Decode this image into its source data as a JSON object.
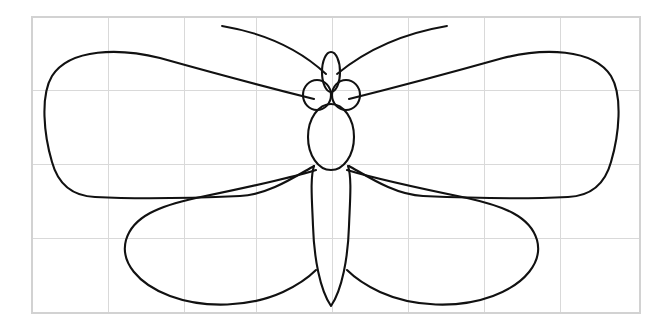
{
  "document": {
    "title": "Butterfly Line Drawing",
    "subject": "butterfly",
    "style": "black outline line art on white background with light gray grid overlay",
    "width_px": 663,
    "height_px": 327,
    "has_text": false,
    "caption": ""
  },
  "colors": {
    "background": "#ffffff",
    "ink": "#111111",
    "grid_line": "#d9d9d9",
    "grid_border": "#d2d2d2"
  },
  "grid": {
    "label": "reference grid",
    "visible": true,
    "border_left": 32,
    "border_top": 17,
    "border_right": 640,
    "border_bottom": 313,
    "columns": 8,
    "rows": 4,
    "cell_width": 76,
    "cell_height": 74,
    "vertical_lines": [
      32,
      108,
      184,
      256,
      332,
      408,
      484,
      560,
      640
    ],
    "horizontal_lines": [
      17,
      90,
      164,
      238,
      313
    ]
  },
  "figure": {
    "name": "butterfly",
    "axis_of_symmetry_x": 331,
    "parts": [
      {
        "id": "antenna-left",
        "label": "left antenna",
        "tip": [
          222,
          26
        ],
        "base": [
          326,
          72
        ],
        "path": "M 222 26 C 258 32 296 46 326 74"
      },
      {
        "id": "antenna-right",
        "label": "right antenna",
        "tip": [
          447,
          26
        ],
        "base": [
          336,
          72
        ],
        "path": "M 447 26 C 411 32 371 46 337 74"
      },
      {
        "id": "head-proboscis",
        "label": "head crown ellipse",
        "center": [
          331,
          72
        ],
        "rx": 9,
        "ry": 20
      },
      {
        "id": "eye-left",
        "label": "left eye circle",
        "center": [
          317,
          95
        ],
        "rx": 14,
        "ry": 15
      },
      {
        "id": "eye-right",
        "label": "right eye circle",
        "center": [
          346,
          95
        ],
        "rx": 14,
        "ry": 15
      },
      {
        "id": "thorax",
        "label": "thorax oval",
        "center": [
          331,
          137
        ],
        "rx": 23,
        "ry": 33
      },
      {
        "id": "abdomen",
        "label": "abdomen tapering to pointed tip",
        "top_y": 168,
        "tip": [
          331,
          306
        ],
        "max_half_width": 17
      },
      {
        "id": "forewing-left",
        "label": "left forewing",
        "attach": [
          314,
          99
        ],
        "outer_tip": [
          47,
          120
        ],
        "top_apex": [
          115,
          55
        ],
        "trailing_edge_end": [
          240,
          196
        ]
      },
      {
        "id": "forewing-right",
        "label": "right forewing",
        "attach": [
          349,
          99
        ],
        "outer_tip": [
          616,
          120
        ],
        "top_apex": [
          548,
          55
        ],
        "trailing_edge_end": [
          423,
          196
        ]
      },
      {
        "id": "hindwing-left",
        "label": "left hindwing",
        "attach": [
          316,
          170
        ],
        "outer_tip": [
          128,
          238
        ],
        "bottom_end": [
          300,
          278
        ]
      },
      {
        "id": "hindwing-right",
        "label": "right hindwing",
        "attach": [
          347,
          170
        ],
        "outer_tip": [
          535,
          238
        ],
        "bottom_end": [
          363,
          278
        ]
      }
    ]
  }
}
